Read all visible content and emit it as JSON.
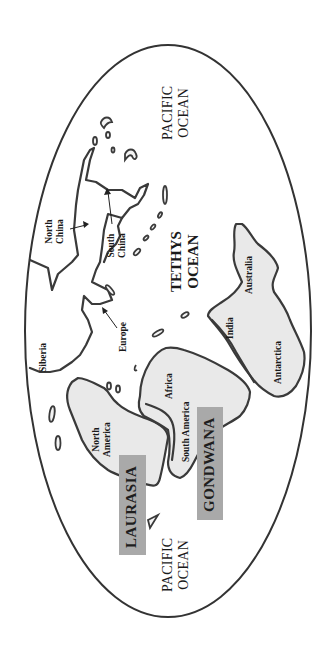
{
  "map": {
    "title": "Pangaea breakup: Laurasia and Gondwana",
    "colors": {
      "outline": "#3a3a3a",
      "land_fill": "#e9e9e9",
      "label_box": "#a9a9a9",
      "background": "#ffffff"
    },
    "oceans": {
      "pacific_top": "PACIFIC\nOCEAN",
      "pacific_top_line1": "PACIFIC",
      "pacific_top_line2": "OCEAN",
      "tethys_line1": "TETHYS",
      "tethys_line2": "OCEAN",
      "pacific_bottom_line1": "PACIFIC",
      "pacific_bottom_line2": "OCEAN"
    },
    "supercontinents": {
      "laurasia": "LAURASIA",
      "gondwana": "GONDWANA"
    },
    "regions": {
      "north_china_line1": "North",
      "north_china_line2": "China",
      "south_china_line1": "South",
      "south_china_line2": "China",
      "siberia": "Siberia",
      "europe": "Europe",
      "north_america_line1": "North",
      "north_america_line2": "America",
      "africa": "Africa",
      "south_america": "South America",
      "india": "India",
      "australia": "Australia",
      "antarctica": "Antarctica"
    }
  }
}
